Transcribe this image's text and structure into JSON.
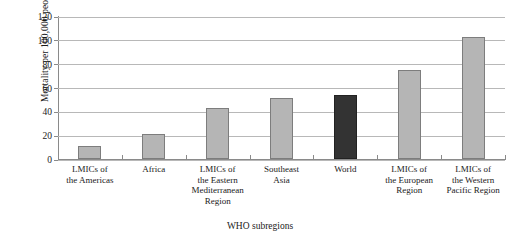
{
  "chart_data": {
    "type": "bar",
    "title": "",
    "xlabel": "WHO subregions",
    "ylabel": "Mortality per 100,000 people",
    "categories": [
      "LMICs of the Americas",
      "Africa",
      "LMICs of the Eastern Mediterranean Region",
      "Southeast Asia",
      "World",
      "LMICs of the European Region",
      "LMICs of the Western Pacific Region"
    ],
    "category_lines": [
      [
        "LMICs of",
        "the Americas"
      ],
      [
        "Africa"
      ],
      [
        "LMICs of",
        "the Eastern",
        "Mediterranean",
        "Region"
      ],
      [
        "Southeast",
        "Asia"
      ],
      [
        "World"
      ],
      [
        "LMICs of",
        "the European",
        "Region"
      ],
      [
        "LMICs of",
        "the Western",
        "Pacific Region"
      ]
    ],
    "values": [
      11,
      21,
      43,
      51,
      54,
      75,
      102
    ],
    "highlight_index": 4,
    "ylim": [
      0,
      120
    ],
    "yticks": [
      0,
      20,
      40,
      60,
      80,
      100,
      120
    ],
    "ytick_labels": [
      "0",
      "20",
      "40",
      "60",
      "80",
      "100",
      "120"
    ],
    "grid": true,
    "legend": "none",
    "colors": {
      "bar": "#b5b5b5",
      "bar_border": "#7d7d7d",
      "bar_highlight": "#333333",
      "gridline": "#b8b8b8",
      "axis": "#8a8a8a",
      "text": "#1a1a1a",
      "background": "#ffffff"
    }
  }
}
